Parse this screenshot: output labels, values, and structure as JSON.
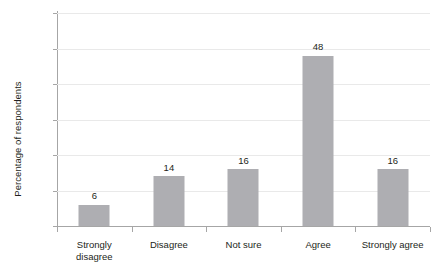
{
  "chart_data": {
    "type": "bar",
    "title": "",
    "xlabel": "",
    "ylabel": "Percentage of respondents",
    "categories": [
      "Strongly disagree",
      "Disagree",
      "Not sure",
      "Agree",
      "Strongly agree"
    ],
    "category_lines": [
      [
        "Strongly",
        "disagree"
      ],
      [
        "Disagree"
      ],
      [
        "Not sure"
      ],
      [
        "Agree"
      ],
      [
        "Strongly agree"
      ]
    ],
    "values": [
      6,
      14,
      16,
      48,
      16
    ],
    "value_labels": [
      "6",
      "14",
      "16",
      "48",
      "16"
    ],
    "ylim": [
      0,
      60
    ],
    "yticks": [
      0,
      10,
      20,
      30,
      40,
      50,
      60
    ],
    "ytick_labels": [
      "0",
      "10",
      "20",
      "30",
      "40",
      "50",
      "60"
    ],
    "grid": true,
    "legend": "none",
    "bar_color": "#aeaeb2",
    "gridline_color": "#e9e9e9",
    "axis_color": "#a6a6a6",
    "text_color": "#231f20"
  }
}
